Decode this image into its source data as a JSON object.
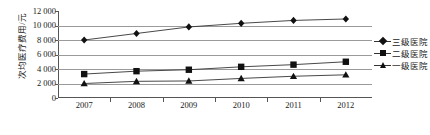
{
  "chart_data": {
    "type": "line",
    "title": "",
    "subtitle": "",
    "xlabel": "",
    "ylabel": "次均医疗费用/元",
    "categories": [
      "2007",
      "2008",
      "2009",
      "2010",
      "2011",
      "2012"
    ],
    "ylim": [
      0,
      12000
    ],
    "ytick_step": 2000,
    "ytick_labels": [
      "12 000",
      "10 000",
      "8 000",
      "6 000",
      "4 000",
      "2 000",
      "0"
    ],
    "ytick_values": [
      12000,
      10000,
      8000,
      6000,
      4000,
      2000,
      0
    ],
    "grid": true,
    "grid_axis": "y",
    "legend_position": "right",
    "series": [
      {
        "name": "三级医院",
        "marker": "diamond",
        "values": [
          8000,
          8900,
          9800,
          10300,
          10700,
          10900
        ]
      },
      {
        "name": "二级医院",
        "marker": "square",
        "values": [
          3300,
          3700,
          3900,
          4300,
          4600,
          5000
        ]
      },
      {
        "name": "一级医院",
        "marker": "triangle",
        "values": [
          2000,
          2300,
          2350,
          2700,
          3000,
          3200
        ]
      }
    ]
  },
  "colors": {
    "line": "#333333",
    "marker": "#111111",
    "grid": "#9a9a9a",
    "axis": "#555555",
    "text": "#1a1a1a",
    "background": "#ffffff"
  },
  "legend": {
    "items": [
      {
        "label": "三级医院",
        "marker": "diamond"
      },
      {
        "label": "二级医院",
        "marker": "square"
      },
      {
        "label": "一级医院",
        "marker": "triangle"
      }
    ]
  }
}
